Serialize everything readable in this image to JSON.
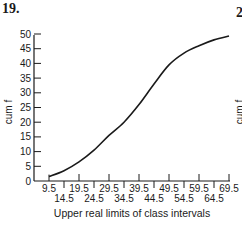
{
  "figure": {
    "number": "19.",
    "next_figure_number_partial": "2",
    "next_figure_ylabel_partial": "cum f"
  },
  "chart_data": {
    "type": "line",
    "title": "",
    "xlabel": "Upper real limits of class intervals",
    "ylabel": "cum f",
    "x_ticks_row1": [
      "9.5",
      "19.5",
      "29.5",
      "39.5",
      "49.5",
      "59.5",
      "69.5"
    ],
    "x_ticks_row2": [
      "14.5",
      "24.5",
      "34.5",
      "44.5",
      "54.5",
      "64.5"
    ],
    "y_ticks": [
      "0",
      "5",
      "10",
      "15",
      "20",
      "25",
      "30",
      "35",
      "40",
      "45",
      "50"
    ],
    "xlim": [
      9.5,
      69.5
    ],
    "ylim": [
      0,
      50
    ],
    "grid": false,
    "legend": null,
    "smooth_curve": true,
    "x": [
      9.5,
      14.5,
      19.5,
      24.5,
      29.5,
      34.5,
      39.5,
      44.5,
      49.5,
      54.5,
      59.5,
      64.5,
      69.5
    ],
    "values": [
      1.5,
      3.5,
      6.5,
      10.5,
      15.5,
      20,
      26,
      33,
      39.5,
      43.5,
      46,
      48,
      49.3
    ]
  }
}
